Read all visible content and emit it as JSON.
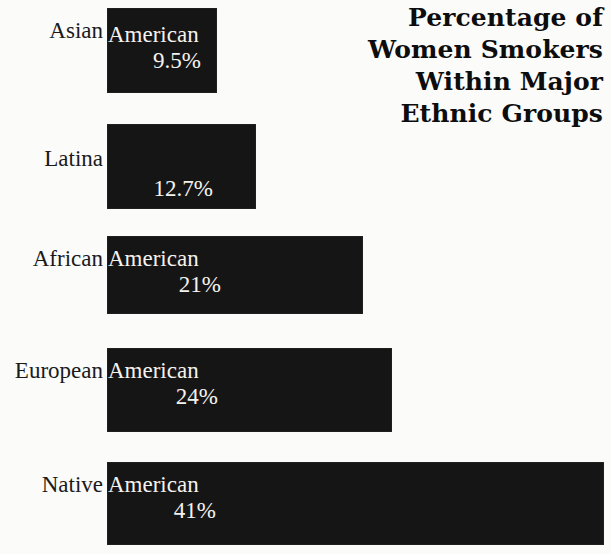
{
  "title": {
    "lines": [
      "Percentage of",
      "Women Smokers",
      "Within Major",
      "Ethnic Groups"
    ],
    "full": "Percentage of Women Smokers Within Major Ethnic Groups"
  },
  "colors": {
    "bar_fill": "#151515",
    "bar_label_text": "#f4f2ee",
    "background": "#fbfbfa",
    "category_text": "#1a1a1a",
    "title_text": "#0d0d0d"
  },
  "chart_data": {
    "type": "bar",
    "orientation": "horizontal",
    "title": "Percentage of Women Smokers Within Major Ethnic Groups",
    "xlabel": "",
    "ylabel": "",
    "xlim": [
      0,
      50
    ],
    "grid": false,
    "legend": false,
    "value_unit": "%",
    "categories": [
      "Asian American",
      "Latina",
      "African American",
      "European American",
      "Native American"
    ],
    "values": [
      9.5,
      12.7,
      21,
      24,
      41
    ],
    "data_labels": [
      "9.5%",
      "12.7%",
      "21%",
      "24%",
      "41%"
    ]
  },
  "bars": [
    {
      "category_prefix": "Asian",
      "inside_label": "American",
      "value_label": "9.5%",
      "value": 9.5,
      "has_inside_label": true
    },
    {
      "category_prefix": "Latina",
      "inside_label": "",
      "value_label": "12.7%",
      "value": 12.7,
      "has_inside_label": false
    },
    {
      "category_prefix": "African",
      "inside_label": "American",
      "value_label": "21%",
      "value": 21,
      "has_inside_label": true
    },
    {
      "category_prefix": "European",
      "inside_label": "American",
      "value_label": "24%",
      "value": 24,
      "has_inside_label": true
    },
    {
      "category_prefix": "Native",
      "inside_label": "American",
      "value_label": "41%",
      "value": 41,
      "has_inside_label": true
    }
  ],
  "layout": {
    "bar_left_px": 107,
    "rows": [
      {
        "top": 8,
        "height": 85,
        "width": 110,
        "label_top": 10,
        "american_top": 14,
        "value_top": 40,
        "value_right_pad": 16
      },
      {
        "top": 124,
        "height": 85,
        "width": 149,
        "label_top": 22,
        "american_top": 14,
        "value_top": 52,
        "value_right_pad": 43
      },
      {
        "top": 236,
        "height": 78,
        "width": 256,
        "label_top": 10,
        "american_top": 10,
        "value_top": 36,
        "value_right_pad": 142
      },
      {
        "top": 348,
        "height": 84,
        "width": 285,
        "label_top": 10,
        "american_top": 10,
        "value_top": 36,
        "value_right_pad": 174
      },
      {
        "top": 462,
        "height": 83,
        "width": 497,
        "label_top": 10,
        "american_top": 10,
        "value_top": 36,
        "value_right_pad": 388
      }
    ]
  }
}
